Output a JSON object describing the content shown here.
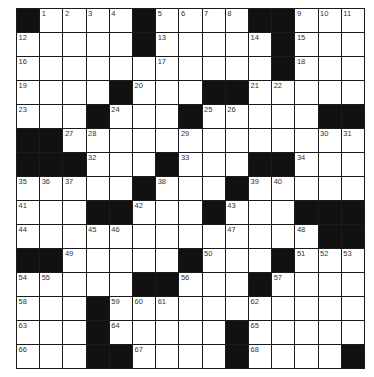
{
  "puzzle": {
    "rows": 15,
    "cols": 15,
    "colors": {
      "block": "#111111",
      "cell": "#ffffff",
      "border": "#1a1a1a",
      "number": "#333333"
    },
    "grid": [
      [
        "#",
        "1",
        "2",
        "3",
        "4",
        "#",
        "5",
        "6",
        "7",
        "8",
        "#",
        "#",
        "9",
        "10",
        "11"
      ],
      [
        "12",
        "",
        "",
        "",
        "",
        "#",
        "13",
        "",
        "",
        "",
        "14",
        "#",
        "15",
        "",
        ""
      ],
      [
        "16",
        "",
        "",
        "",
        "",
        "",
        "17",
        "",
        "",
        "",
        "",
        "#",
        "18",
        "",
        ""
      ],
      [
        "19",
        "",
        "",
        "",
        "#",
        "20",
        "",
        "",
        "#",
        "#",
        "21",
        "22",
        "",
        "",
        ""
      ],
      [
        "23",
        "",
        "",
        "#",
        "24",
        "",
        "",
        "#",
        "25",
        "26",
        "",
        "",
        "",
        "#",
        "#"
      ],
      [
        "#",
        "#",
        "27",
        "28",
        "",
        "",
        "",
        "29",
        "",
        "",
        "",
        "",
        "",
        "30",
        "31"
      ],
      [
        "#",
        "#",
        "#",
        "32",
        "",
        "",
        "#",
        "33",
        "",
        "",
        "#",
        "#",
        "34",
        "",
        ""
      ],
      [
        "35",
        "36",
        "37",
        "",
        "",
        "#",
        "38",
        "",
        "",
        "#",
        "39",
        "40",
        "",
        "",
        ""
      ],
      [
        "41",
        "",
        "",
        "#",
        "#",
        "42",
        "",
        "",
        "#",
        "43",
        "",
        "",
        "#",
        "#",
        "#"
      ],
      [
        "44",
        "",
        "",
        "45",
        "46",
        "",
        "",
        "",
        "",
        "47",
        "",
        "",
        "48",
        "#",
        "#"
      ],
      [
        "#",
        "#",
        "49",
        "",
        "",
        "",
        "",
        "#",
        "50",
        "",
        "",
        "#",
        "51",
        "52",
        "53"
      ],
      [
        "54",
        "55",
        "",
        "",
        "",
        "#",
        "#",
        "56",
        "",
        "",
        "#",
        "57",
        "",
        "",
        ""
      ],
      [
        "58",
        "",
        "",
        "#",
        "59",
        "60",
        "61",
        "",
        "",
        "",
        "62",
        "",
        "",
        "",
        ""
      ],
      [
        "63",
        "",
        "",
        "#",
        "64",
        "",
        "",
        "",
        "",
        "#",
        "65",
        "",
        "",
        "",
        ""
      ],
      [
        "66",
        "",
        "",
        "#",
        "#",
        "67",
        "",
        "",
        "",
        "#",
        "68",
        "",
        "",
        "",
        "#"
      ]
    ]
  }
}
